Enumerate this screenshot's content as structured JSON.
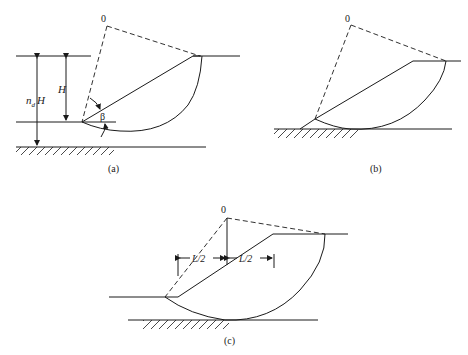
{
  "figure": {
    "panels": [
      {
        "id": "a",
        "caption": "(a)",
        "center_label": "0",
        "labels": {
          "depth_ratio": "n",
          "depth_sub": "d",
          "depth_H": "H",
          "height": "H",
          "angle": "β"
        }
      },
      {
        "id": "b",
        "caption": "(b)",
        "center_label": "0"
      },
      {
        "id": "c",
        "caption": "(c)",
        "center_label": "0",
        "labels": {
          "half_length_left": "L/2",
          "half_length_right": "L/2"
        }
      }
    ]
  }
}
